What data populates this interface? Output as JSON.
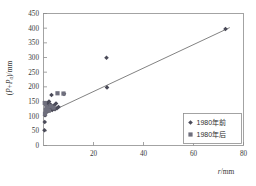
{
  "chart_data": {
    "type": "scatter",
    "title": "",
    "xlabel": "r/mm",
    "ylabel": "(P+P_a)/mm",
    "xlim": [
      0,
      80
    ],
    "ylim": [
      0,
      450
    ],
    "grid": false,
    "legend_position": "bottom-right",
    "x_ticks": [
      0,
      20,
      40,
      60,
      80
    ],
    "x_tick_labels": [
      "0",
      "20",
      "40",
      "60",
      "80"
    ],
    "y_ticks": [
      0,
      50,
      100,
      150,
      200,
      250,
      300,
      350,
      400,
      450
    ],
    "y_tick_labels": [
      "0",
      "50",
      "100",
      "150",
      "200",
      "250",
      "300",
      "350",
      "400",
      "450"
    ],
    "series": [
      {
        "name": "1980年前",
        "marker": "diamond",
        "color": "#4a4a58",
        "points": [
          [
            0.4,
            52
          ],
          [
            0.5,
            80
          ],
          [
            0.6,
            103
          ],
          [
            0.8,
            112
          ],
          [
            1.0,
            122
          ],
          [
            1.1,
            136
          ],
          [
            1.3,
            128
          ],
          [
            1.5,
            143
          ],
          [
            1.7,
            118
          ],
          [
            2.0,
            133
          ],
          [
            2.2,
            150
          ],
          [
            2.5,
            126
          ],
          [
            2.8,
            140
          ],
          [
            3.2,
            172
          ],
          [
            3.5,
            121
          ],
          [
            3.8,
            130
          ],
          [
            4.2,
            136
          ],
          [
            4.6,
            124
          ],
          [
            5.0,
            143
          ],
          [
            5.4,
            127
          ],
          [
            6.0,
            131
          ],
          [
            8.2,
            176
          ],
          [
            25.2,
            299
          ],
          [
            25.4,
            198
          ],
          [
            72.8,
            397
          ]
        ]
      },
      {
        "name": "1980年后",
        "marker": "square",
        "color": "#6f6f7d",
        "points": [
          [
            0.5,
            145
          ],
          [
            0.6,
            108
          ],
          [
            0.9,
            121
          ],
          [
            1.2,
            132
          ],
          [
            1.6,
            127
          ],
          [
            2.1,
            119
          ],
          [
            3.0,
            134
          ],
          [
            4.0,
            129
          ],
          [
            5.6,
            178
          ],
          [
            8.0,
            177
          ]
        ]
      }
    ],
    "trendline": {
      "x0": 0.0,
      "y0": 104,
      "x1": 74.5,
      "y1": 402
    }
  },
  "legend": {
    "entries": [
      {
        "label": "1980年前",
        "marker": "diamond"
      },
      {
        "label": "1980年后",
        "marker": "square"
      }
    ]
  }
}
